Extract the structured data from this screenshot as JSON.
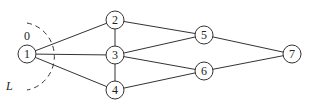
{
  "diagram": {
    "type": "graph",
    "nodes": [
      {
        "id": "1",
        "label": "1",
        "x": 27,
        "y": 54
      },
      {
        "id": "2",
        "label": "2",
        "x": 115,
        "y": 20
      },
      {
        "id": "3",
        "label": "3",
        "x": 115,
        "y": 55
      },
      {
        "id": "4",
        "label": "4",
        "x": 115,
        "y": 90
      },
      {
        "id": "5",
        "label": "5",
        "x": 204,
        "y": 35
      },
      {
        "id": "6",
        "label": "6",
        "x": 204,
        "y": 71
      },
      {
        "id": "7",
        "label": "7",
        "x": 292,
        "y": 54
      }
    ],
    "edges": [
      [
        "1",
        "2"
      ],
      [
        "1",
        "3"
      ],
      [
        "1",
        "4"
      ],
      [
        "2",
        "3"
      ],
      [
        "3",
        "4"
      ],
      [
        "2",
        "5"
      ],
      [
        "3",
        "5"
      ],
      [
        "3",
        "6"
      ],
      [
        "4",
        "6"
      ],
      [
        "5",
        "7"
      ],
      [
        "6",
        "7"
      ]
    ],
    "annotations": {
      "zero_label": "0",
      "cut_label": "L"
    }
  }
}
